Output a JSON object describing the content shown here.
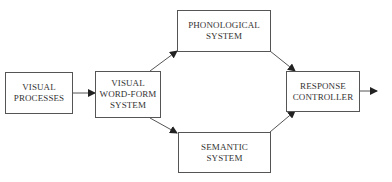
{
  "diagram": {
    "type": "flowchart",
    "colors": {
      "stroke": "#555555",
      "text": "#333333",
      "background": "#ffffff"
    },
    "nodes": [
      {
        "id": "visual_processes",
        "lines": [
          "VISUAL",
          "PROCESSES"
        ]
      },
      {
        "id": "visual_word_form",
        "lines": [
          "VISUAL",
          "WORD-FORM",
          "SYSTEM"
        ]
      },
      {
        "id": "phonological",
        "lines": [
          "PHONOLOGICAL",
          "SYSTEM"
        ]
      },
      {
        "id": "semantic",
        "lines": [
          "SEMANTIC",
          "SYSTEM"
        ]
      },
      {
        "id": "response_controller",
        "lines": [
          "RESPONSE",
          "CONTROLLER"
        ]
      }
    ],
    "edges": [
      {
        "from": "visual_processes",
        "to": "visual_word_form"
      },
      {
        "from": "visual_word_form",
        "to": "phonological"
      },
      {
        "from": "visual_word_form",
        "to": "semantic"
      },
      {
        "from": "phonological",
        "to": "response_controller"
      },
      {
        "from": "semantic",
        "to": "response_controller"
      },
      {
        "from": "response_controller",
        "to": "output"
      }
    ]
  }
}
